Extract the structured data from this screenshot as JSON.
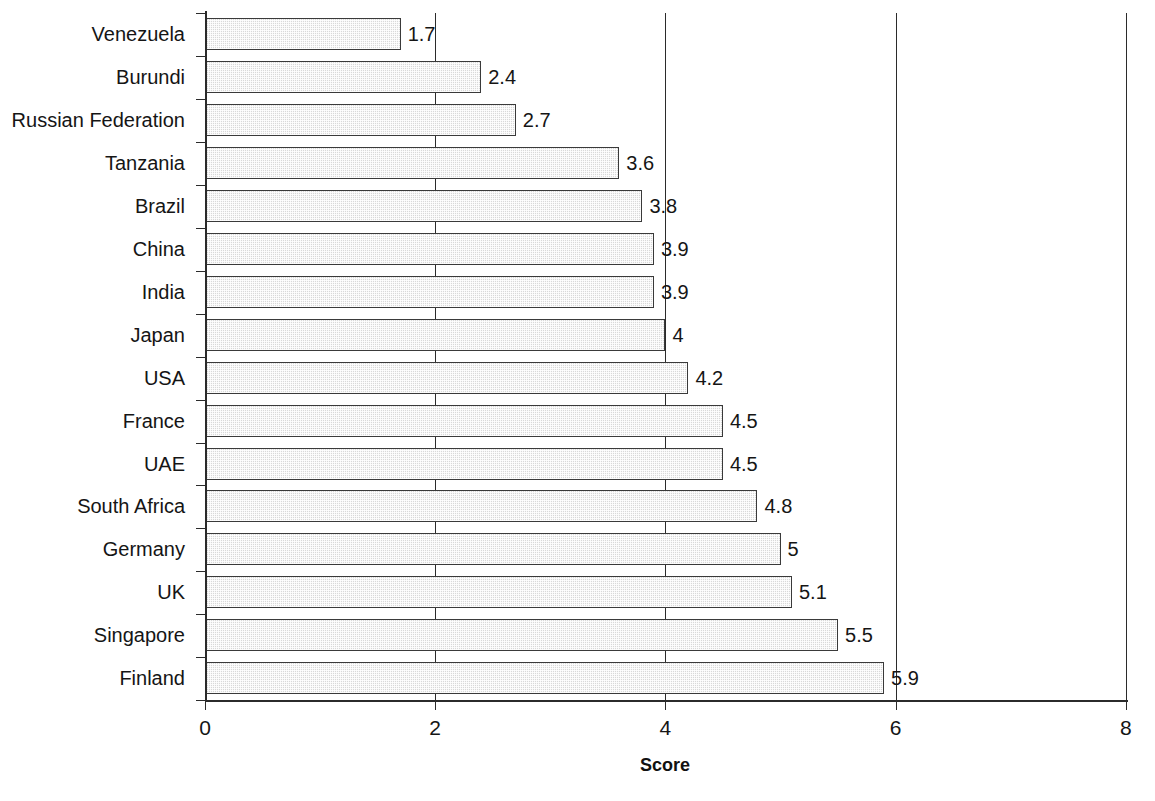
{
  "chart_data": {
    "type": "bar",
    "orientation": "horizontal",
    "title": "",
    "xlabel": "Score",
    "ylabel": "",
    "xlim": [
      0,
      8
    ],
    "xticks": [
      0,
      2,
      4,
      6,
      8
    ],
    "xtick_labels": [
      "0",
      "2",
      "4",
      "6",
      "8"
    ],
    "grid": "vertical gridlines at 2, 4, 6, 8",
    "legend": "none",
    "bar_fill_color": "#d9d9d9",
    "bar_edge_color": "#3a3a3a",
    "categories": [
      "Venezuela",
      "Burundi",
      "Russian Federation",
      "Tanzania",
      "Brazil",
      "China",
      "India",
      "Japan",
      "USA",
      "France",
      "UAE",
      "South Africa",
      "Germany",
      "UK",
      "Singapore",
      "Finland"
    ],
    "values": [
      1.7,
      2.4,
      2.7,
      3.6,
      3.8,
      3.9,
      3.9,
      4,
      4.2,
      4.5,
      4.5,
      4.8,
      5,
      5.1,
      5.5,
      5.9
    ],
    "value_labels": [
      "1.7",
      "2.4",
      "2.7",
      "3.6",
      "3.8",
      "3.9",
      "3.9",
      "4",
      "4.2",
      "4.5",
      "4.5",
      "4.8",
      "5",
      "5.1",
      "5.5",
      "5.9"
    ]
  }
}
